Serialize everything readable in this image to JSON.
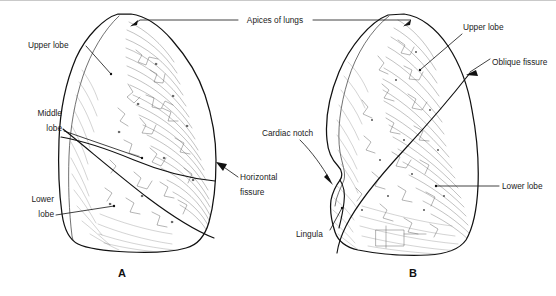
{
  "figure": {
    "background_color": "#ffffff",
    "ink_color": "#111111",
    "width": 556,
    "height": 296
  },
  "panels": [
    {
      "letter": "A",
      "name": "right-lung",
      "description": "Right lung, lateral view showing upper, middle and lower lobes separated by horizontal and oblique fissures"
    },
    {
      "letter": "B",
      "name": "left-lung",
      "description": "Left lung, lateral view showing upper and lower lobes separated by the oblique fissure, with cardiac notch and lingula"
    }
  ],
  "labels": {
    "apices_of_lungs": "Apices of lungs",
    "upper_lobe_left_panel": "Upper lobe",
    "middle_lobe_line1": "Middle",
    "middle_lobe_line2": "lobe",
    "lower_lobe_line1": "Lower",
    "lower_lobe_line2": "lobe",
    "horizontal_fissure_line1": "Horizontal",
    "horizontal_fissure_line2": "fissure",
    "cardiac_notch": "Cardiac notch",
    "lingula": "Lingula",
    "upper_lobe_right_panel": "Upper lobe",
    "oblique_fissure": "Oblique fissure",
    "lower_lobe_right_panel": "Lower lobe"
  },
  "panel_letters": {
    "a": "A",
    "b": "B"
  }
}
